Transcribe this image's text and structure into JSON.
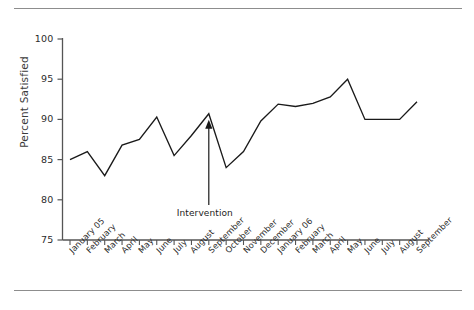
{
  "chart_data": {
    "type": "line",
    "title": "",
    "xlabel": "",
    "ylabel": "Percent Satisfied",
    "ylim": [
      75,
      100
    ],
    "yticks": [
      75,
      80,
      85,
      90,
      95,
      100
    ],
    "grid": false,
    "legend": null,
    "categories": [
      "January 05",
      "February",
      "March",
      "April",
      "May",
      "June",
      "July",
      "August",
      "September",
      "October",
      "November",
      "December",
      "January 06",
      "February",
      "March",
      "April",
      "May",
      "June",
      "July",
      "August",
      "September"
    ],
    "values": [
      85,
      86,
      83,
      86.8,
      87.5,
      90.3,
      85.5,
      88,
      90.7,
      84,
      86,
      89.8,
      91.9,
      91.6,
      92,
      92.8,
      95,
      90,
      90,
      90,
      92.2
    ],
    "annotations": [
      {
        "text": "Intervention",
        "points_to_category": "September",
        "points_to_value": 90.7,
        "marker": "arrow-up"
      }
    ],
    "line_color": "#1a1a1a",
    "axis_color": "#555555"
  },
  "axis": {
    "y_tick_labels": [
      "100",
      "95",
      "90",
      "85",
      "80",
      "75"
    ],
    "y_axis_title": "Percent Satisfied"
  },
  "annotation": {
    "intervention_label": "Intervention"
  }
}
